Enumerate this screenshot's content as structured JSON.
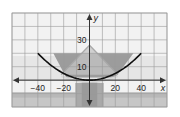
{
  "chart_data": {
    "type": "line",
    "title": "",
    "xlabel": "x",
    "ylabel": "y",
    "xlim": [
      -60,
      60
    ],
    "ylim": [
      -20,
      50
    ],
    "grid": true,
    "grid_step": 10,
    "x_ticks": [
      {
        "value": -40,
        "label": "−40"
      },
      {
        "value": -20,
        "label": "−20"
      },
      {
        "value": 20,
        "label": "20"
      },
      {
        "value": 40,
        "label": "40"
      }
    ],
    "y_ticks": [
      {
        "value": 10,
        "label": "10"
      },
      {
        "value": 30,
        "label": "30"
      }
    ],
    "series": [
      {
        "name": "parabola",
        "equation": "y = x^2 / 80",
        "x_range": [
          -40,
          40
        ],
        "x": [
          -40,
          -30,
          -20,
          -10,
          0,
          10,
          20,
          30,
          40
        ],
        "y": [
          20,
          11.25,
          5,
          1.25,
          0,
          1.25,
          5,
          11.25,
          20
        ],
        "color": "#111111"
      }
    ],
    "background": "photo of satellite dish (grayscale)"
  },
  "colors": {
    "grid": "#9a9a9a",
    "axis": "#333333",
    "curve": "#111111",
    "dish_dark": "#8e8e8e",
    "dish_light": "#c4c4c4",
    "sky": "#f2f2f2",
    "ground": "#b8b8b8"
  }
}
